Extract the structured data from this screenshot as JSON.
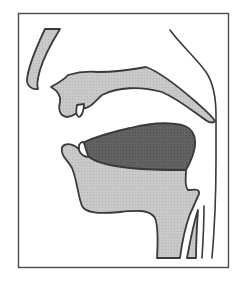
{
  "diagram": {
    "type": "midsagittal vocal tract section",
    "labels": [],
    "colors": {
      "background": "#ffffff",
      "frame": "#4a4a4a",
      "soft_tissue": "#c4c4c4",
      "tongue": "#5e5e5e",
      "teeth": "#ffffff",
      "outline": "#3a3a3a"
    },
    "parts": [
      {
        "id": "nose",
        "name": "Nose"
      },
      {
        "id": "upper-lip-palate",
        "name": "Upper lip, alveolar ridge and hard/soft palate"
      },
      {
        "id": "upper-tooth",
        "name": "Upper incisor"
      },
      {
        "id": "lower-tooth",
        "name": "Lower incisor"
      },
      {
        "id": "tongue",
        "name": "Tongue body (raised)"
      },
      {
        "id": "lower-lip-jaw",
        "name": "Lower lip, jaw and floor of mouth"
      },
      {
        "id": "pharynx-wall",
        "name": "Back wall of pharynx"
      },
      {
        "id": "epiglottis",
        "name": "Epiglottis"
      },
      {
        "id": "larynx",
        "name": "Larynx / trachea walls"
      }
    ]
  }
}
